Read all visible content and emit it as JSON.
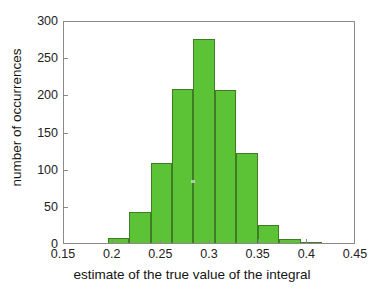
{
  "chart_data": {
    "type": "bar",
    "title": "",
    "subtitle": "",
    "xlabel": "estimate of the true value of the integral",
    "ylabel": "number of occurrences",
    "xlim": [
      0.15,
      0.45
    ],
    "ylim": [
      0,
      300
    ],
    "grid": false,
    "legend": null,
    "bin_width": 0.022,
    "bar_color": "#5CC236",
    "bar_edge_color": "#3F7D25",
    "axis_color": "#8A8A8A",
    "xticks": [
      0.15,
      0.2,
      0.25,
      0.3,
      0.35,
      0.4,
      0.45
    ],
    "xtick_labels": [
      "0.15",
      "0.2",
      "0.25",
      "0.3",
      "0.35",
      "0.4",
      "0.45"
    ],
    "yticks": [
      0,
      50,
      100,
      150,
      200,
      250,
      300
    ],
    "ytick_labels": [
      "0",
      "50",
      "100",
      "150",
      "200",
      "250",
      "300"
    ],
    "bins": [
      {
        "left": 0.195,
        "right": 0.217,
        "center": 0.206,
        "value": 7
      },
      {
        "left": 0.217,
        "right": 0.239,
        "center": 0.228,
        "value": 42
      },
      {
        "left": 0.239,
        "right": 0.261,
        "center": 0.25,
        "value": 107
      },
      {
        "left": 0.261,
        "right": 0.283,
        "center": 0.272,
        "value": 207
      },
      {
        "left": 0.283,
        "right": 0.305,
        "center": 0.294,
        "value": 274
      },
      {
        "left": 0.305,
        "right": 0.327,
        "center": 0.316,
        "value": 206
      },
      {
        "left": 0.327,
        "right": 0.349,
        "center": 0.338,
        "value": 121
      },
      {
        "left": 0.349,
        "right": 0.371,
        "center": 0.36,
        "value": 24
      },
      {
        "left": 0.371,
        "right": 0.393,
        "center": 0.382,
        "value": 6
      },
      {
        "left": 0.393,
        "right": 0.415,
        "center": 0.404,
        "value": 2
      }
    ],
    "categories": [
      "0.206",
      "0.228",
      "0.250",
      "0.272",
      "0.294",
      "0.316",
      "0.338",
      "0.360",
      "0.382",
      "0.404"
    ],
    "values": [
      7,
      42,
      107,
      207,
      274,
      206,
      121,
      24,
      6,
      2
    ]
  }
}
